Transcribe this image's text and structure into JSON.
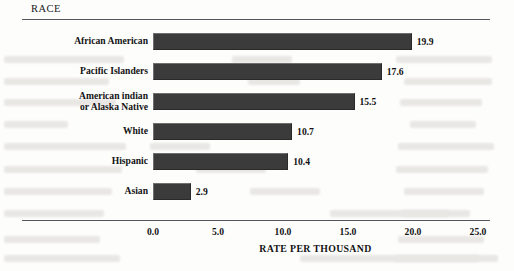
{
  "header": {
    "group_label": "RACE"
  },
  "chart_data": {
    "type": "bar",
    "orientation": "horizontal",
    "title": "RACE",
    "xlabel": "RATE PER THOUSAND",
    "ylabel": "",
    "xlim": [
      0.0,
      25.0
    ],
    "xticks": [
      "0.0",
      "5.0",
      "10.0",
      "15.0",
      "20.0",
      "25.0"
    ],
    "xtick_values": [
      0.0,
      5.0,
      10.0,
      15.0,
      20.0,
      25.0
    ],
    "grid": false,
    "legend": false,
    "bar_color": "#3b3b3b",
    "categories": [
      "African American",
      "Pacific Islanders",
      "American indian\nor Alaska Native",
      "White",
      "Hispanic",
      "Asian"
    ],
    "values": [
      19.9,
      17.6,
      15.5,
      10.7,
      10.4,
      2.9
    ],
    "value_labels": [
      "19.9",
      "17.6",
      "15.5",
      "10.7",
      "10.4",
      "2.9"
    ],
    "bars": [
      {
        "label_line1": "African American",
        "label_line2": "",
        "value": 19.9,
        "value_label": "19.9"
      },
      {
        "label_line1": "Pacific Islanders",
        "label_line2": "",
        "value": 17.6,
        "value_label": "17.6"
      },
      {
        "label_line1": "American indian",
        "label_line2": "or Alaska Native",
        "value": 15.5,
        "value_label": "15.5"
      },
      {
        "label_line1": "White",
        "label_line2": "",
        "value": 10.7,
        "value_label": "10.7"
      },
      {
        "label_line1": "Hispanic",
        "label_line2": "",
        "value": 10.4,
        "value_label": "10.4"
      },
      {
        "label_line1": "Asian",
        "label_line2": "",
        "value": 2.9,
        "value_label": "2.9"
      }
    ]
  }
}
